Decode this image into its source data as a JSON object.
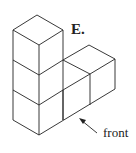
{
  "figure": {
    "option_label": "E.",
    "front_label": "front",
    "line_color": "#222222"
  }
}
